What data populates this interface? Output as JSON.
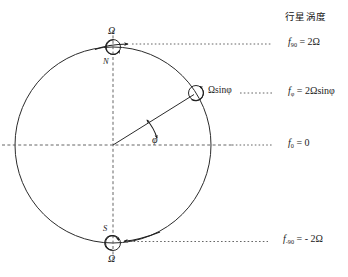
{
  "figure": {
    "title": "行星涡度",
    "background": "#ffffff",
    "stroke_color": "#2b2b2b",
    "dash_color": "#555555"
  },
  "sphere": {
    "center_x": 113,
    "center_y": 145,
    "radius": 98,
    "equator_label": "equator-dashed-line",
    "axis_label": "rotation-axis-dashed-line"
  },
  "poles": {
    "north": {
      "letter": "N",
      "omega_label": "Ω",
      "marker": "counterclockwise-rotation-circle",
      "x": 113,
      "y": 47
    },
    "south": {
      "letter": "S",
      "omega_label": "Ω",
      "marker": "clockwise-rotation-circle",
      "x": 113,
      "y": 243
    }
  },
  "latitude_point": {
    "marker": "rotation-component-circle",
    "vector_label": "Ωsinφ",
    "angle_label": "φ",
    "x": 196,
    "y": 93
  },
  "vorticity_labels": [
    {
      "id": "f90",
      "symbol": "f",
      "subscript": "90",
      "value": "2Ω",
      "text": "f₉₀ = 2Ω",
      "y": 44
    },
    {
      "id": "fphi",
      "symbol": "f",
      "subscript": "φ",
      "value": "2Ωsinφ",
      "text": "f_φ = 2Ωsinφ",
      "y": 93
    },
    {
      "id": "f0",
      "symbol": "f",
      "subscript": "0",
      "value": "0",
      "text": "f₀ = 0",
      "y": 145
    },
    {
      "id": "fm90",
      "symbol": "f",
      "subscript": "-90",
      "value": "- 2Ω",
      "text": "f₋₉₀ = -2Ω",
      "y": 241
    }
  ]
}
